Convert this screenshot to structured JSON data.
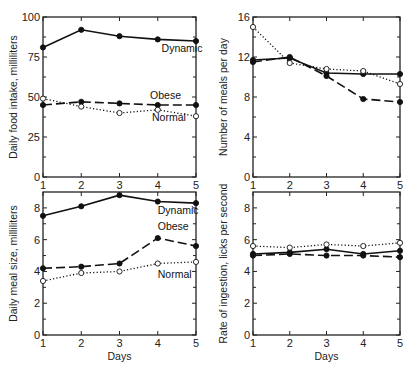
{
  "chart_data": [
    {
      "type": "line",
      "title": "",
      "xlabel": "",
      "ylabel": "Daily food intake, milliliters",
      "x": [
        1,
        2,
        3,
        4,
        5
      ],
      "xticks": [
        "1",
        "2",
        "3",
        "4",
        "5"
      ],
      "yticks": [
        "0",
        "25",
        "50",
        "75",
        "100"
      ],
      "ylim": [
        0,
        100
      ],
      "grid": false,
      "series": [
        {
          "name": "Dynamic",
          "style": "solid-filled",
          "values": [
            81,
            92,
            88,
            86,
            85
          ]
        },
        {
          "name": "Obese",
          "style": "dashed-filled",
          "values": [
            45,
            47,
            46,
            45,
            45
          ]
        },
        {
          "name": "Normal",
          "style": "dotted-open",
          "values": [
            49,
            44,
            40,
            42,
            38
          ]
        }
      ],
      "annotations": [
        {
          "text": "Dynamic",
          "x": 4.1,
          "y": 78
        },
        {
          "text": "Obese",
          "x": 3.8,
          "y": 49
        },
        {
          "text": "Normal",
          "x": 3.85,
          "y": 35
        }
      ]
    },
    {
      "type": "line",
      "title": "",
      "xlabel": "",
      "ylabel": "Number of meals per day",
      "x": [
        1,
        2,
        3,
        4,
        5
      ],
      "xticks": [
        "1",
        "2",
        "3",
        "4",
        "5"
      ],
      "yticks": [
        "0",
        "4",
        "8",
        "12",
        "16"
      ],
      "ylim": [
        0,
        16
      ],
      "grid": false,
      "series": [
        {
          "name": "Dynamic",
          "style": "solid-filled",
          "values": [
            11.7,
            11.9,
            10.4,
            10.3,
            10.3
          ]
        },
        {
          "name": "Obese",
          "style": "dashed-filled",
          "values": [
            11.5,
            12.0,
            10.1,
            7.8,
            7.5
          ]
        },
        {
          "name": "Normal",
          "style": "dotted-open",
          "values": [
            15.0,
            11.4,
            10.8,
            10.6,
            9.3
          ]
        }
      ],
      "annotations": []
    },
    {
      "type": "line",
      "title": "",
      "xlabel": "Days",
      "ylabel": "Daily meal size, milliliters",
      "x": [
        1,
        2,
        3,
        4,
        5
      ],
      "xticks": [
        "1",
        "2",
        "3",
        "4",
        "5"
      ],
      "yticks": [
        "0",
        "2",
        "4",
        "6",
        "8"
      ],
      "ylim": [
        0,
        9
      ],
      "grid": false,
      "series": [
        {
          "name": "Dynamic",
          "style": "solid-filled",
          "values": [
            7.5,
            8.1,
            8.8,
            8.4,
            8.3
          ]
        },
        {
          "name": "Obese",
          "style": "dashed-filled",
          "values": [
            4.2,
            4.3,
            4.5,
            6.1,
            5.6
          ]
        },
        {
          "name": "Normal",
          "style": "dotted-open",
          "values": [
            3.4,
            3.9,
            4.0,
            4.5,
            4.6
          ]
        }
      ],
      "annotations": [
        {
          "text": "Dynamic",
          "x": 4.0,
          "y": 7.6
        },
        {
          "text": "Obese",
          "x": 4.0,
          "y": 6.6
        },
        {
          "text": "Normal",
          "x": 4.0,
          "y": 3.6
        }
      ]
    },
    {
      "type": "line",
      "title": "",
      "xlabel": "Days",
      "ylabel": "Rate of ingestion, licks per second",
      "x": [
        1,
        2,
        3,
        4,
        5
      ],
      "xticks": [
        "1",
        "2",
        "3",
        "4",
        "5"
      ],
      "yticks": [
        "0",
        "2",
        "4",
        "6",
        "8"
      ],
      "ylim": [
        0,
        9
      ],
      "grid": false,
      "series": [
        {
          "name": "Dynamic",
          "style": "solid-filled",
          "values": [
            5.1,
            5.2,
            5.4,
            5.1,
            5.3
          ]
        },
        {
          "name": "Obese",
          "style": "dashed-filled",
          "values": [
            5.0,
            5.1,
            5.0,
            5.0,
            4.9
          ]
        },
        {
          "name": "Normal",
          "style": "dotted-open",
          "values": [
            5.6,
            5.5,
            5.7,
            5.6,
            5.8
          ]
        }
      ],
      "annotations": []
    }
  ]
}
